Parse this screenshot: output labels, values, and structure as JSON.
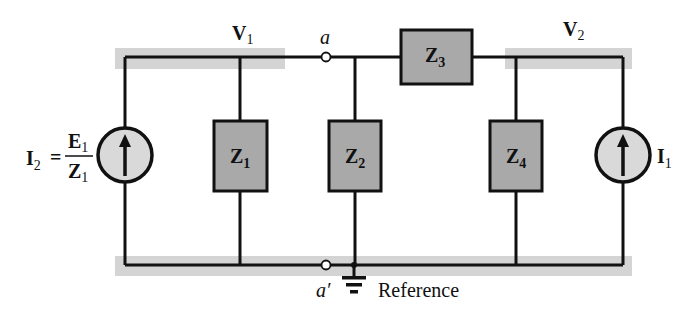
{
  "diagram": {
    "type": "nodal-analysis-circuit",
    "colors": {
      "wire": "#111111",
      "component_fill": "#a9a9a9",
      "source_fill": "#d9d9d9",
      "node_highlight": "#d4d4d4",
      "background": "#ffffff"
    },
    "nodes": {
      "v1": {
        "label": "V",
        "sub": "1"
      },
      "v2": {
        "label": "V",
        "sub": "2"
      },
      "a": {
        "label": "a"
      },
      "a_prime": {
        "label": "a′"
      },
      "reference": {
        "label": "Reference"
      }
    },
    "components": {
      "z1": {
        "label": "Z",
        "sub": "1"
      },
      "z2": {
        "label": "Z",
        "sub": "2"
      },
      "z3": {
        "label": "Z",
        "sub": "3"
      },
      "z4": {
        "label": "Z",
        "sub": "4"
      }
    },
    "sources": {
      "left": {
        "label": "I",
        "sub": "2",
        "equals": "=",
        "numerator": "E",
        "numerator_sub": "1",
        "denominator": "Z",
        "denominator_sub": "1",
        "direction": "up"
      },
      "right": {
        "label": "I",
        "sub": "1",
        "direction": "up"
      }
    }
  }
}
